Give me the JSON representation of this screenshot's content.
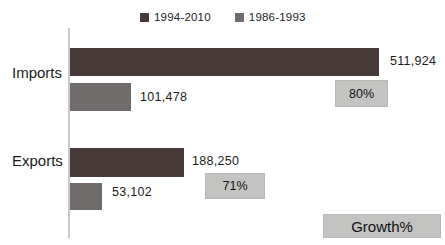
{
  "chart_data": {
    "type": "bar",
    "orientation": "horizontal",
    "title": "",
    "categories": [
      "Imports",
      "Exports"
    ],
    "series": [
      {
        "name": "1994-2010",
        "color": "#483a38",
        "values": [
          511924,
          188250
        ],
        "labels": [
          "511,924",
          "188,250"
        ]
      },
      {
        "name": "1986-1993",
        "color": "#6f6c6b",
        "values": [
          101478,
          53102
        ],
        "labels": [
          "101,478",
          "53,102"
        ]
      }
    ],
    "growth": {
      "label": "Growth%",
      "values": [
        "80%",
        "71%"
      ],
      "box_color": "#c3c3c2"
    },
    "legend_position": "top",
    "grid": false,
    "axis_color": "#c9c9c9",
    "background": "#ffffff",
    "x_max": 511924
  }
}
